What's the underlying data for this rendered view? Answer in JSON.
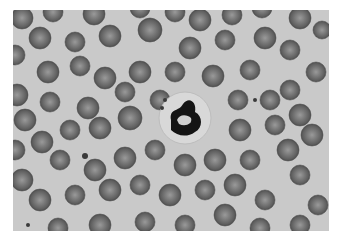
{
  "image": {
    "subject": "blood smear micrograph",
    "background_color": "#c9c9c9",
    "border_color": "#ffffff",
    "rbc_color": "#6a6a6a",
    "rbc_center_color": "#9a9a9a",
    "nucleus_color": "#111111"
  },
  "rbcs": [
    [
      22,
      18,
      11
    ],
    [
      53,
      12,
      10
    ],
    [
      94,
      14,
      11
    ],
    [
      140,
      8,
      10
    ],
    [
      175,
      12,
      10
    ],
    [
      200,
      20,
      11
    ],
    [
      232,
      15,
      10
    ],
    [
      262,
      8,
      10
    ],
    [
      300,
      18,
      11
    ],
    [
      322,
      30,
      9
    ],
    [
      15,
      55,
      10
    ],
    [
      40,
      38,
      11
    ],
    [
      75,
      42,
      10
    ],
    [
      110,
      36,
      11
    ],
    [
      150,
      30,
      12
    ],
    [
      190,
      48,
      11
    ],
    [
      225,
      40,
      10
    ],
    [
      265,
      38,
      11
    ],
    [
      290,
      50,
      10
    ],
    [
      316,
      72,
      10
    ],
    [
      17,
      95,
      11
    ],
    [
      48,
      72,
      11
    ],
    [
      80,
      66,
      10
    ],
    [
      105,
      78,
      11
    ],
    [
      140,
      72,
      11
    ],
    [
      175,
      72,
      10
    ],
    [
      213,
      76,
      11
    ],
    [
      250,
      70,
      10
    ],
    [
      290,
      90,
      10
    ],
    [
      25,
      120,
      11
    ],
    [
      50,
      102,
      10
    ],
    [
      88,
      108,
      11
    ],
    [
      125,
      92,
      10
    ],
    [
      160,
      100,
      10
    ],
    [
      238,
      100,
      10
    ],
    [
      270,
      100,
      10
    ],
    [
      300,
      115,
      11
    ],
    [
      15,
      150,
      10
    ],
    [
      42,
      142,
      11
    ],
    [
      70,
      130,
      10
    ],
    [
      100,
      128,
      11
    ],
    [
      130,
      118,
      12
    ],
    [
      240,
      130,
      11
    ],
    [
      275,
      125,
      10
    ],
    [
      312,
      135,
      11
    ],
    [
      22,
      180,
      11
    ],
    [
      60,
      160,
      10
    ],
    [
      95,
      170,
      11
    ],
    [
      125,
      158,
      11
    ],
    [
      155,
      150,
      10
    ],
    [
      185,
      165,
      11
    ],
    [
      215,
      160,
      11
    ],
    [
      250,
      160,
      10
    ],
    [
      288,
      150,
      11
    ],
    [
      40,
      200,
      11
    ],
    [
      75,
      195,
      10
    ],
    [
      110,
      190,
      11
    ],
    [
      140,
      185,
      10
    ],
    [
      170,
      195,
      11
    ],
    [
      205,
      190,
      10
    ],
    [
      235,
      185,
      11
    ],
    [
      265,
      200,
      10
    ],
    [
      300,
      175,
      10
    ],
    [
      318,
      205,
      10
    ],
    [
      58,
      228,
      10
    ],
    [
      100,
      225,
      11
    ],
    [
      145,
      222,
      10
    ],
    [
      185,
      225,
      10
    ],
    [
      225,
      215,
      11
    ],
    [
      260,
      228,
      10
    ],
    [
      300,
      225,
      10
    ]
  ],
  "wbc": {
    "cx": 185,
    "cy": 118,
    "r": 26
  },
  "platelets": [
    [
      165,
      100,
      2
    ],
    [
      162,
      108,
      2
    ],
    [
      85,
      156,
      3
    ],
    [
      255,
      100,
      2
    ],
    [
      28,
      225,
      2
    ]
  ]
}
